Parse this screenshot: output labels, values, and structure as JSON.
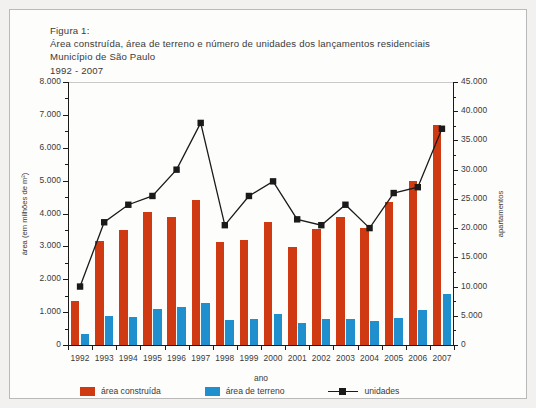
{
  "figure": {
    "label": "Figura 1:",
    "title": "Área construída, área de terreno e número de unidades dos lançamentos residenciais",
    "subtitle": "Município de São Paulo",
    "period": "1992 - 2007"
  },
  "legend": {
    "items": [
      {
        "key": "area-construida",
        "label": "área construída",
        "color": "#d03a13"
      },
      {
        "key": "area-de-terreno",
        "label": "área de terreno",
        "color": "#1f8fce"
      },
      {
        "key": "unidades",
        "label": "unidades",
        "color": "#1a1a1a"
      }
    ]
  },
  "axes": {
    "x_title": "ano",
    "y_left_title": "área (em milhões de m²)",
    "y_right_title": "apartamentos",
    "y_left_ticks": [
      "0",
      "1.000",
      "2.000",
      "3.000",
      "4.000",
      "5.000",
      "6.000",
      "7.000",
      "8.000"
    ],
    "y_right_ticks": [
      "0",
      "5.000",
      "10.000",
      "15.000",
      "20.000",
      "25.000",
      "30.000",
      "35.000",
      "40.000",
      "45.000"
    ]
  },
  "chart_data": {
    "type": "bar",
    "title": "Área construída, área de terreno e número de unidades dos lançamentos residenciais",
    "subtitle": "Município de São Paulo, 1992 - 2007",
    "xlabel": "ano",
    "ylabel": "área (em milhões de m²)",
    "y2label": "apartamentos",
    "ylim": [
      0,
      8000
    ],
    "y2lim": [
      0,
      45000
    ],
    "ytick_step": 1000,
    "y2tick_step": 5000,
    "grid": false,
    "legend_position": "bottom",
    "categories": [
      "1992",
      "1993",
      "1994",
      "1995",
      "1996",
      "1997",
      "1998",
      "1999",
      "2000",
      "2001",
      "2002",
      "2003",
      "2004",
      "2005",
      "2006",
      "2007"
    ],
    "series": [
      {
        "name": "área construída",
        "type": "bar",
        "axis": "left",
        "color": "#d03a13",
        "values": [
          1350,
          3150,
          3500,
          4050,
          3900,
          4420,
          3120,
          3200,
          3750,
          2980,
          3520,
          3880,
          3560,
          4350,
          5000,
          6700
        ]
      },
      {
        "name": "área de terreno",
        "type": "bar",
        "axis": "left",
        "color": "#1f8fce",
        "values": [
          350,
          880,
          840,
          1100,
          1150,
          1280,
          760,
          800,
          930,
          660,
          780,
          800,
          720,
          830,
          1080,
          1540
        ]
      },
      {
        "name": "unidades",
        "type": "line",
        "axis": "right",
        "color": "#1a1a1a",
        "marker": "square",
        "values": [
          10000,
          21000,
          24000,
          25500,
          30000,
          38000,
          20500,
          25500,
          28000,
          21500,
          20500,
          24000,
          20000,
          26000,
          27000,
          37000
        ]
      }
    ]
  }
}
